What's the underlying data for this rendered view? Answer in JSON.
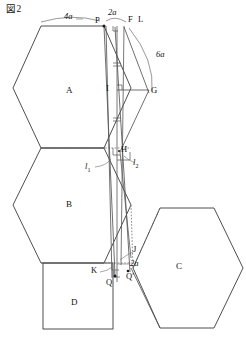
{
  "figure": {
    "title": "図2",
    "regions": [
      {
        "id": "A",
        "label": "A"
      },
      {
        "id": "B",
        "label": "B"
      },
      {
        "id": "C",
        "label": "C"
      },
      {
        "id": "D",
        "label": "D"
      }
    ],
    "points": [
      {
        "id": "P",
        "label": "P"
      },
      {
        "id": "F",
        "label": "F"
      },
      {
        "id": "L",
        "label": "L"
      },
      {
        "id": "G",
        "label": "G"
      },
      {
        "id": "I",
        "label": "I"
      },
      {
        "id": "H",
        "label": "H"
      },
      {
        "id": "J",
        "label": "J"
      },
      {
        "id": "K",
        "label": "K"
      },
      {
        "id": "Q",
        "label": "Q"
      },
      {
        "id": "Qp",
        "label": "Q′"
      }
    ],
    "measurements": [
      {
        "id": "m4a",
        "label": "4a"
      },
      {
        "id": "m2a",
        "label": "2a"
      },
      {
        "id": "m6a",
        "label": "6a"
      },
      {
        "id": "m2a2",
        "label": "2a"
      }
    ],
    "lines": [
      {
        "id": "l1",
        "label": "l",
        "sub": "1"
      },
      {
        "id": "l2",
        "label": "l",
        "sub": "2"
      }
    ],
    "colors": {
      "stroke": "#3a3a3a",
      "thin": "#555555",
      "dotted": "#6b6b6b",
      "text": "#121212",
      "background": "#ffffff"
    }
  }
}
